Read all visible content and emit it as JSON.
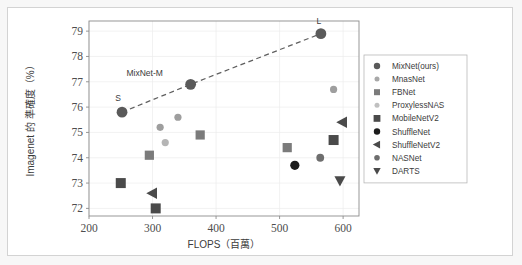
{
  "chart_data": {
    "type": "scatter",
    "title": "",
    "xlabel": "FLOPS（百萬）",
    "ylabel": "Imagenet 的 準確度（%）",
    "xlim": [
      200,
      625
    ],
    "ylim": [
      71.7,
      79.4
    ],
    "xticks": [
      "200",
      "300",
      "400",
      "500",
      "600"
    ],
    "xtick_values": [
      200,
      300,
      400,
      500,
      600
    ],
    "yticks": [
      "72",
      "73",
      "74",
      "75",
      "76",
      "77",
      "78",
      "79"
    ],
    "ytick_values": [
      72,
      73,
      74,
      75,
      76,
      77,
      78,
      79
    ],
    "grid": true,
    "legend_position": "right-outside",
    "series": [
      {
        "name": "MixNet(ours)",
        "marker": "circle",
        "color": "#5a5a5a",
        "size": 5.4,
        "points": [
          {
            "x": 252,
            "y": 75.8
          },
          {
            "x": 360,
            "y": 76.9
          },
          {
            "x": 565,
            "y": 78.9
          }
        ]
      },
      {
        "name": "MnasNet",
        "marker": "circle",
        "color": "#9e9e9e",
        "size": 3.6,
        "points": [
          {
            "x": 312,
            "y": 75.2
          },
          {
            "x": 340,
            "y": 75.6
          },
          {
            "x": 585,
            "y": 76.7
          }
        ]
      },
      {
        "name": "FBNet",
        "marker": "square",
        "color": "#7b7b7b",
        "size": 4.6,
        "points": [
          {
            "x": 295,
            "y": 74.1
          },
          {
            "x": 375,
            "y": 74.9
          },
          {
            "x": 512,
            "y": 74.4
          }
        ]
      },
      {
        "name": "ProxylessNAS",
        "marker": "circle",
        "color": "#b5b5b5",
        "size": 3.6,
        "points": [
          {
            "x": 320,
            "y": 74.6
          }
        ]
      },
      {
        "name": "MobileNetV2",
        "marker": "square",
        "color": "#4a4a4a",
        "size": 5.0,
        "points": [
          {
            "x": 250,
            "y": 73.0
          },
          {
            "x": 305,
            "y": 72.0
          },
          {
            "x": 585,
            "y": 74.7
          }
        ]
      },
      {
        "name": "ShuffleNet",
        "marker": "circle",
        "color": "#1c1c1c",
        "size": 4.6,
        "points": [
          {
            "x": 524,
            "y": 73.7
          }
        ]
      },
      {
        "name": "ShuffleNetV2",
        "marker": "triangle-left",
        "color": "#4a4a4a",
        "size": 5.0,
        "points": [
          {
            "x": 300,
            "y": 72.6
          },
          {
            "x": 599,
            "y": 75.4
          }
        ]
      },
      {
        "name": "NASNet",
        "marker": "circle",
        "color": "#6e6e6e",
        "size": 3.9,
        "points": [
          {
            "x": 564,
            "y": 74.0
          }
        ]
      },
      {
        "name": "DARTS",
        "marker": "triangle-down",
        "color": "#4a4a4a",
        "size": 4.8,
        "points": [
          {
            "x": 595,
            "y": 73.1
          }
        ]
      }
    ],
    "trendline": {
      "style": "dashed",
      "color": "#5f5f5f",
      "points": [
        {
          "x": 252,
          "y": 75.8
        },
        {
          "x": 360,
          "y": 76.9
        },
        {
          "x": 565,
          "y": 78.9
        }
      ]
    },
    "annotations": [
      {
        "text": "S",
        "x": 252,
        "y": 75.8,
        "dx": -4,
        "dy": -11
      },
      {
        "text": "MixNet-M",
        "x": 360,
        "y": 76.9,
        "dx": -46,
        "dy": -8
      },
      {
        "text": "L",
        "x": 565,
        "y": 78.9,
        "dx": -2,
        "dy": -10
      }
    ]
  },
  "legend": {
    "items": [
      {
        "label": "MixNet(ours)",
        "marker": "circle",
        "color": "#5a5a5a",
        "size": 3.2
      },
      {
        "label": "MnasNet",
        "marker": "circle",
        "color": "#a8a8a8",
        "size": 2.5
      },
      {
        "label": "FBNet",
        "marker": "square",
        "color": "#7b7b7b",
        "size": 3.0
      },
      {
        "label": "ProxylessNAS",
        "marker": "circle",
        "color": "#c0c0c0",
        "size": 2.5
      },
      {
        "label": "MobileNetV2",
        "marker": "square",
        "color": "#4a4a4a",
        "size": 3.4
      },
      {
        "label": "ShuffleNet",
        "marker": "circle",
        "color": "#1c1c1c",
        "size": 3.2
      },
      {
        "label": "ShuffleNetV2",
        "marker": "triangle-left",
        "color": "#4a4a4a",
        "size": 3.4
      },
      {
        "label": "NASNet",
        "marker": "circle",
        "color": "#6e6e6e",
        "size": 2.8
      },
      {
        "label": "DARTS",
        "marker": "triangle-down",
        "color": "#4a4a4a",
        "size": 3.2
      }
    ]
  },
  "colors": {
    "page_background": "#f7f7f7",
    "card_background": "#ffffff",
    "card_border": "#d3d3d3",
    "axis": "#8c8c8c",
    "grid": "#ececec",
    "text": "#3b3b3b",
    "tick_text": "#4d4d4d"
  }
}
